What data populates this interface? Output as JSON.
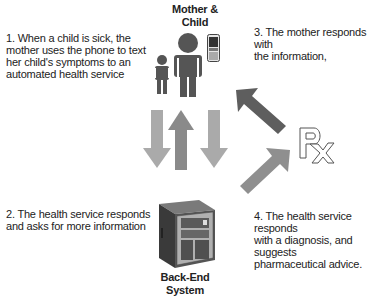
{
  "nodes": {
    "mother_child": {
      "label_line1": "Mother &",
      "label_line2": "Child"
    },
    "backend": {
      "label_line1": "Back-End",
      "label_line2": "System"
    },
    "pharmacy": {
      "symbol": "Rx"
    }
  },
  "steps": [
    {
      "line1": "1. When a child is sick, the",
      "line2": "mother uses the phone to text",
      "line3": "her child's symptoms to an",
      "line4": "automated health service"
    },
    {
      "line1": "2. The health service responds",
      "line2": "and asks for more information"
    },
    {
      "line1": "3. The mother responds with",
      "line2": "the information,"
    },
    {
      "line1": "4. The health service responds",
      "line2": "with a diagnosis, and suggests",
      "line3": "pharmaceutical advice."
    }
  ],
  "icons": {
    "person": "person-icon",
    "phone": "mobile-phone-icon",
    "server": "server-tower-icon",
    "rx": "prescription-icon"
  },
  "colors": {
    "arrow_light": "#a8a8a8",
    "arrow_mid": "#8a8a8a",
    "arrow_dark": "#5e5e5e",
    "figure": "#555555"
  }
}
